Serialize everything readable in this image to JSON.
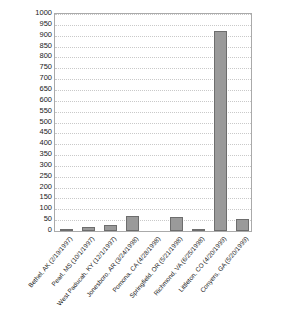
{
  "chart_data": {
    "type": "bar",
    "title": "",
    "subtitle": "",
    "xlabel": "",
    "ylabel": "",
    "ylim": [
      0,
      1000
    ],
    "ytick_step": 50,
    "grid": true,
    "legend": "none",
    "bar_color": "#9a9a9a",
    "bar_edge_color": "#6d6d6d",
    "axis_color": "#aaaaaa",
    "gridline_color": "#c9c9c9",
    "categories": [
      "Bethel, AK (2/19/1997)",
      "Pearl, MS (10/1/1997)",
      "West Paducah, KY (12/1/1997)",
      "Jonesboro, AR (3/24/1998)",
      "Pomona, CA (4/28/1998)",
      "Springfield, OR (5/21/1998)",
      "Richmond, VA (6/25/1998)",
      "Littleton, CO (4/20/1999)",
      "Conyers, GA (5/20/1999)"
    ],
    "values": [
      5,
      20,
      30,
      70,
      0,
      65,
      6,
      920,
      55
    ],
    "ytick_labels": [
      "1000",
      "950",
      "900",
      "850",
      "800",
      "750",
      "700",
      "650",
      "600",
      "550",
      "500",
      "450",
      "400",
      "350",
      "300",
      "250",
      "200",
      "150",
      "100",
      "50",
      "0"
    ],
    "ytick_values": [
      1000,
      950,
      900,
      850,
      800,
      750,
      700,
      650,
      600,
      550,
      500,
      450,
      400,
      350,
      300,
      250,
      200,
      150,
      100,
      50,
      0
    ]
  }
}
